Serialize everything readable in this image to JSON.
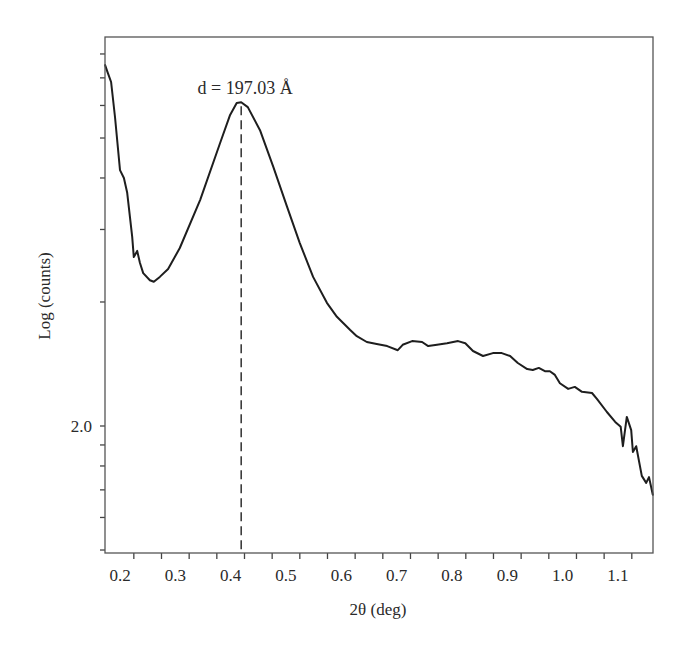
{
  "chart_data": {
    "type": "line",
    "title": "",
    "xlabel": "2θ (deg)",
    "ylabel": "Log (counts)",
    "xlim": [
      0.173,
      1.164
    ],
    "ylim": [
      1.692,
      2.955
    ],
    "grid": false,
    "legend": null,
    "x_tick_labels": [
      "0.2",
      "0.3",
      "0.4",
      "0.5",
      "0.6",
      "0.7",
      "0.8",
      "0.9",
      "1.0",
      "1.1"
    ],
    "x_tick_values": [
      0.2,
      0.3,
      0.4,
      0.5,
      0.6,
      0.7,
      0.8,
      0.9,
      1.0,
      1.1
    ],
    "x_minor_ticks": [
      0.225,
      0.275,
      0.325,
      0.375,
      0.425,
      0.475,
      0.525,
      0.575,
      0.625,
      0.675,
      0.725,
      0.775,
      0.825,
      0.875,
      0.925,
      0.975,
      1.025,
      1.075,
      1.125
    ],
    "y_tick_labels": [
      "2.0"
    ],
    "y_tick_values": [
      2.0
    ],
    "y_minor_ticks": [
      1.699,
      1.778,
      1.845,
      1.903,
      1.954,
      2.301,
      2.477,
      2.602,
      2.699,
      2.778,
      2.845,
      2.903
    ],
    "annotations": [
      {
        "text": "d = 197.03 Å",
        "x": 0.419,
        "y": 2.786,
        "marker": "vertical dashed line at peak"
      }
    ],
    "series": [
      {
        "name": "XRD intensity",
        "x": [
          0.173,
          0.178,
          0.184,
          0.191,
          0.2,
          0.207,
          0.213,
          0.222,
          0.225,
          0.231,
          0.236,
          0.242,
          0.254,
          0.261,
          0.272,
          0.287,
          0.308,
          0.345,
          0.381,
          0.399,
          0.411,
          0.419,
          0.431,
          0.453,
          0.477,
          0.502,
          0.525,
          0.549,
          0.574,
          0.592,
          0.616,
          0.628,
          0.646,
          0.664,
          0.683,
          0.702,
          0.711,
          0.728,
          0.746,
          0.757,
          0.773,
          0.791,
          0.811,
          0.824,
          0.838,
          0.856,
          0.874,
          0.89,
          0.905,
          0.919,
          0.936,
          0.946,
          0.957,
          0.968,
          0.977,
          0.986,
          0.995,
          1.01,
          1.022,
          1.035,
          1.053,
          1.062,
          1.08,
          1.095,
          1.105,
          1.109,
          1.116,
          1.124,
          1.127,
          1.133,
          1.143,
          1.151,
          1.156,
          1.163
        ],
        "values": [
          2.876,
          2.857,
          2.835,
          2.75,
          2.621,
          2.602,
          2.566,
          2.459,
          2.41,
          2.425,
          2.396,
          2.371,
          2.354,
          2.35,
          2.362,
          2.381,
          2.432,
          2.549,
          2.687,
          2.755,
          2.784,
          2.786,
          2.774,
          2.718,
          2.629,
          2.532,
          2.444,
          2.362,
          2.299,
          2.265,
          2.233,
          2.218,
          2.204,
          2.199,
          2.194,
          2.184,
          2.197,
          2.206,
          2.204,
          2.194,
          2.197,
          2.201,
          2.206,
          2.201,
          2.182,
          2.17,
          2.177,
          2.177,
          2.17,
          2.153,
          2.138,
          2.136,
          2.141,
          2.133,
          2.133,
          2.124,
          2.104,
          2.09,
          2.095,
          2.083,
          2.08,
          2.066,
          2.034,
          2.01,
          1.998,
          1.951,
          2.022,
          1.99,
          1.937,
          1.951,
          1.879,
          1.862,
          1.876,
          1.833
        ]
      }
    ],
    "peak": {
      "x": 0.419,
      "y": 2.786,
      "label": "d = 197.03 Å"
    }
  },
  "layout": {
    "plot_left": 105,
    "plot_right": 653,
    "plot_top": 37,
    "plot_bottom": 553,
    "x_ref_value": 0.2,
    "x_ref_px": 120,
    "x_px_per_unit": 553.3,
    "y_ref_value": 2.0,
    "y_ref_px": 426,
    "y_px_per_unit": 412
  }
}
